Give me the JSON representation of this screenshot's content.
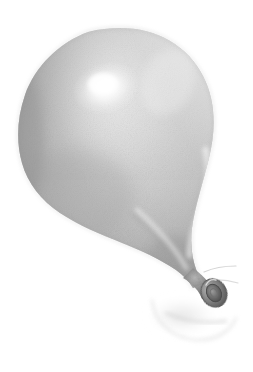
{
  "artwork": {
    "title": "Balloon",
    "medium": "graphite pencil drawing",
    "subject": "inflated latex balloon, pear shaped, tilted toward lower right",
    "background_color": "#ffffff",
    "canvas": {
      "width": 253,
      "height": 372
    }
  },
  "palette": {
    "background": "#ffffff",
    "balloon_highlight": "#fbfbfb",
    "balloon_light": "#e2e2e2",
    "balloon_mid": "#c3c3c3",
    "balloon_shade": "#a9a9a9",
    "balloon_dark": "#939393",
    "outline": "#8a8a8a",
    "knot_dark": "#6e6e6e",
    "knot_darkest": "#4f4f4f",
    "ground_shadow": "#dcdcdc",
    "reflection": "#ededed"
  },
  "shapes": {
    "body": {
      "name": "balloon-body",
      "path": "M 120 28 C 157 28 188 46 203 76 C 216 101 216 130 209 158 C 203 183 195 206 192 228 C 190 245 192 259 197 272 C 199 277 201 281 202 284 L 193 288 C 189 281 183 275 176 270 C 160 259 140 250 122 243 C 100 234 78 225 60 213 C 41 200 28 184 22 163 C 16 142 17 118 25 95 C 35 66 60 42 88 32 C 99 29 110 28 120 28 Z",
      "description": "large rounded top tapering to a narrow neck at lower right"
    },
    "neck": {
      "name": "balloon-neck",
      "path": "M 195 272 C 199 276 203 280 206 284 C 209 288 212 292 213 296 L 203 299 C 200 294 196 290 192 287 C 189 285 186 283 184 282 Z"
    },
    "knot_ring": {
      "name": "balloon-knot-ring",
      "cx": 214,
      "cy": 293,
      "rx": 12,
      "ry": 14,
      "rotation": -28
    },
    "highlight": {
      "name": "specular-highlight",
      "cx": 106,
      "cy": 88,
      "rx": 34,
      "ry": 26
    },
    "secondary_highlight": {
      "name": "rim-highlight-right",
      "path": "M 206 150 C 211 170 206 196 197 220 C 193 232 190 244 190 255"
    },
    "crease": {
      "name": "fold-crease",
      "path": "M 137 210 C 157 228 175 248 186 268"
    },
    "ground_shadow": {
      "name": "ground-shadow",
      "cx": 182,
      "cy": 316,
      "rx": 36,
      "ry": 18
    },
    "reflection_arc": {
      "name": "reflection-arc",
      "path": "M 152 300 C 154 322 172 338 196 340 C 216 341 231 331 236 318"
    },
    "wisps": [
      {
        "name": "wisp-upper",
        "path": "M 204 272 C 213 268 225 266 236 266"
      },
      {
        "name": "wisp-lower",
        "path": "M 206 281 C 216 279 228 280 238 283"
      },
      {
        "name": "wisp-tail",
        "path": "M 166 313 C 184 321 206 324 226 321"
      }
    ]
  },
  "labels": {
    "alt_text": "Pencil drawing of a gray balloon with a bright highlight on its upper left and a tied knot at the lower right"
  }
}
